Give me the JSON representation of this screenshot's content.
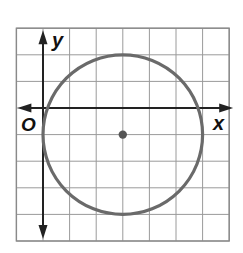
{
  "figure": {
    "axis_labels": {
      "x": "x",
      "y": "y",
      "origin": "O"
    },
    "grid": {
      "x_min": -1,
      "x_max": 7,
      "y_min": -5,
      "y_max": 3,
      "cell_px": 26.6,
      "origin_px": [
        43,
        108
      ],
      "line_color": "#9a9a9a",
      "border_color": "#8a8a8a"
    },
    "circle": {
      "center": [
        3,
        -1
      ],
      "radius": 3,
      "stroke_color": "#6a6a6a",
      "center_dot_color": "#555555"
    },
    "axis_color": "#222222"
  },
  "chart_data": {
    "type": "scatter",
    "title": "",
    "xlabel": "x",
    "ylabel": "y",
    "xlim": [
      -1,
      7
    ],
    "ylim": [
      -5,
      3
    ],
    "grid": true,
    "shapes": [
      {
        "kind": "circle",
        "center": [
          3,
          -1
        ],
        "radius": 3,
        "equation": "(x-3)^2 + (y+1)^2 = 9"
      }
    ],
    "points": [
      {
        "label": "center",
        "x": 3,
        "y": -1
      }
    ],
    "annotations": [
      "O (origin)"
    ]
  }
}
